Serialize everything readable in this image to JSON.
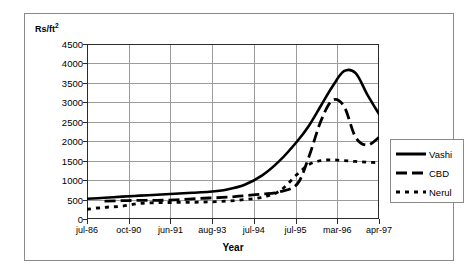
{
  "figure": {
    "y_unit_label": "Rs/ft",
    "y_unit_sup": "2",
    "x_axis_title": "Year"
  },
  "legend": {
    "items": [
      {
        "label": "Vashi",
        "style": "solid",
        "color": "#000000"
      },
      {
        "label": "CBD",
        "style": "dashed",
        "color": "#000000"
      },
      {
        "label": "Nerul",
        "style": "dotted",
        "color": "#000000"
      }
    ]
  },
  "chart_data": {
    "type": "line",
    "title": "",
    "subtitle": "",
    "xlabel": "Year",
    "ylabel": "Rs/ft2",
    "ylim": [
      0,
      4500
    ],
    "yticks": [
      0,
      500,
      1000,
      1500,
      2000,
      2500,
      3000,
      3500,
      4000,
      4500
    ],
    "ytick_labels": [
      "0",
      "500",
      "1000",
      "1500",
      "2000",
      "2500",
      "3000",
      "3500",
      "4000",
      "4500"
    ],
    "categories": [
      "jul-86",
      "oct-90",
      "jun-91",
      "aug-93",
      "jul-94",
      "jul-95",
      "mar-96",
      "apr-97"
    ],
    "grid": true,
    "legend_position": "right",
    "series": [
      {
        "name": "Vashi",
        "style": "solid",
        "color": "#000000",
        "values": [
          520,
          640,
          700,
          1350,
          2700,
          3850,
          2450,
          2700
        ],
        "dense_x": [
          0.0,
          0.06,
          0.12,
          0.18,
          0.24,
          0.3,
          0.36,
          0.42,
          0.48,
          0.54,
          0.6,
          0.66,
          0.72,
          0.76,
          0.8,
          0.84,
          0.88,
          0.92,
          0.96,
          1.0
        ],
        "dense_y": [
          520,
          545,
          575,
          600,
          625,
          650,
          675,
          700,
          760,
          880,
          1120,
          1500,
          2000,
          2400,
          2900,
          3400,
          3800,
          3750,
          3200,
          2700
        ]
      },
      {
        "name": "CBD",
        "style": "dashed",
        "color": "#000000",
        "values": [
          null,
          470,
          490,
          560,
          700,
          3100,
          1950,
          2100
        ],
        "dense_x": [
          0.06,
          0.12,
          0.18,
          0.24,
          0.3,
          0.36,
          0.42,
          0.48,
          0.54,
          0.6,
          0.66,
          0.72,
          0.76,
          0.8,
          0.84,
          0.88,
          0.92,
          0.96,
          1.0
        ],
        "dense_y": [
          460,
          470,
          480,
          480,
          490,
          520,
          540,
          560,
          600,
          640,
          700,
          900,
          1600,
          2500,
          3050,
          2900,
          2100,
          1900,
          2100
        ]
      },
      {
        "name": "Nerul",
        "style": "dotted",
        "color": "#000000",
        "values": [
          250,
          420,
          430,
          480,
          800,
          1520,
          1480,
          1450
        ],
        "dense_x": [
          0.0,
          0.06,
          0.12,
          0.18,
          0.24,
          0.3,
          0.36,
          0.42,
          0.48,
          0.54,
          0.6,
          0.66,
          0.72,
          0.76,
          0.8,
          0.84,
          0.88,
          0.92,
          0.96,
          1.0
        ],
        "dense_y": [
          250,
          300,
          330,
          400,
          420,
          425,
          430,
          440,
          460,
          500,
          560,
          720,
          1150,
          1400,
          1500,
          1520,
          1500,
          1480,
          1460,
          1450
        ]
      }
    ]
  }
}
